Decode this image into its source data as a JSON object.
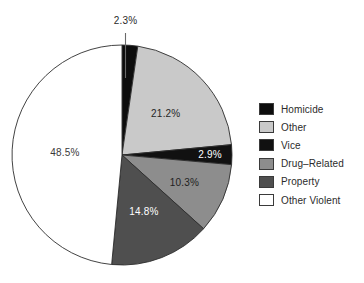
{
  "chart_data": {
    "type": "pie",
    "title": "",
    "subtitle": "",
    "xlabel": "",
    "ylabel": "",
    "grid": false,
    "legend_position": "right",
    "start_angle_deg": -90,
    "direction": "clockwise",
    "categories": [
      "Homicide",
      "Other",
      "Vice",
      "Drug–Related",
      "Property",
      "Other Violent"
    ],
    "values": [
      2.3,
      21.2,
      2.9,
      10.3,
      14.8,
      48.5
    ],
    "value_labels": [
      "2.3%",
      "21.2%",
      "2.9%",
      "10.3%",
      "14.8%",
      "48.5%"
    ],
    "colors": [
      "#0d0d0d",
      "#c9c9c9",
      "#111111",
      "#8d8d8d",
      "#4f4f4f",
      "#ffffff"
    ],
    "label_colors": [
      "#2a2a2a",
      "#262626",
      "#ffffff",
      "#1f1f1f",
      "#ffffff",
      "#3a3a3a"
    ],
    "slices": [
      {
        "label": "Homicide",
        "value": 2.3,
        "value_label": "2.3%",
        "color": "#0d0d0d",
        "label_color": "#2a2a2a",
        "label_placement": "callout-top"
      },
      {
        "label": "Other",
        "value": 21.2,
        "value_label": "21.2%",
        "color": "#c9c9c9",
        "label_color": "#262626",
        "label_placement": "inside"
      },
      {
        "label": "Vice",
        "value": 2.9,
        "value_label": "2.9%",
        "color": "#111111",
        "label_color": "#ffffff",
        "label_placement": "inside"
      },
      {
        "label": "Drug–Related",
        "value": 10.3,
        "value_label": "10.3%",
        "color": "#8d8d8d",
        "label_color": "#1f1f1f",
        "label_placement": "inside"
      },
      {
        "label": "Property",
        "value": 14.8,
        "value_label": "14.8%",
        "color": "#4f4f4f",
        "label_color": "#ffffff",
        "label_placement": "inside"
      },
      {
        "label": "Other Violent",
        "value": 48.5,
        "value_label": "48.5%",
        "color": "#ffffff",
        "label_color": "#3a3a3a",
        "label_placement": "inside"
      }
    ],
    "annotations": [
      {
        "text": "2.3%",
        "for": "Homicide",
        "type": "leader-line"
      }
    ]
  },
  "legend": {
    "items": [
      {
        "label": "Homicide",
        "color": "#0d0d0d"
      },
      {
        "label": "Other",
        "color": "#c9c9c9"
      },
      {
        "label": "Vice",
        "color": "#111111"
      },
      {
        "label": "Drug–Related",
        "color": "#8d8d8d"
      },
      {
        "label": "Property",
        "color": "#4f4f4f"
      },
      {
        "label": "Other Violent",
        "color": "#ffffff"
      }
    ]
  },
  "labels": {
    "homicide_pct": "2.3%",
    "other_pct": "21.2%",
    "vice_pct": "2.9%",
    "drug_related_pct": "10.3%",
    "property_pct": "14.8%",
    "other_violent_pct": "48.5%"
  }
}
